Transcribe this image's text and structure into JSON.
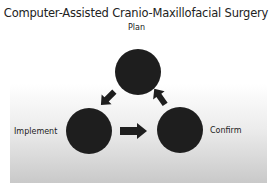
{
  "title": "Computer-Assisted Cranio-Maxillofacial Surgery",
  "nodes": {
    "plan": {
      "label": "Plan",
      "inner_text": ""
    },
    "implement": {
      "label": "Implement",
      "inner_text": ""
    },
    "confirm": {
      "label": "Confirm",
      "inner_text": ""
    }
  },
  "colors": {
    "circle": "#1e1e1e",
    "arrow": "#1e1e1e",
    "panel_bottom": "#c9c9c9"
  }
}
